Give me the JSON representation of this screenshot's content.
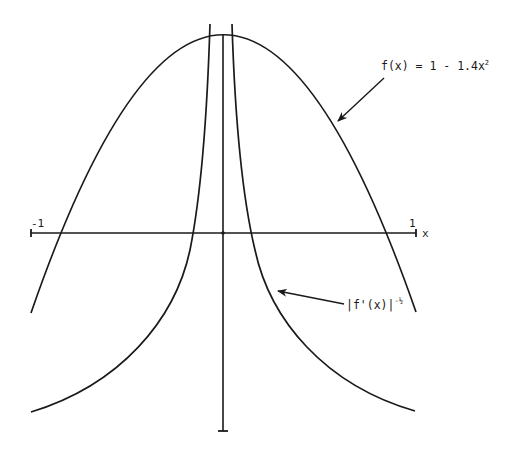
{
  "diagram": {
    "axis": {
      "x_label": "x",
      "left_tick_label": "-1",
      "right_tick_label": "1"
    },
    "labels": {
      "parabola": "f(x) = 1 - 1.4x",
      "parabola_exp": "2",
      "derivative_base": "|f'(x)|",
      "derivative_exp": "-½"
    },
    "colors": {
      "ink": "#1a1a1a",
      "background": "#ffffff"
    }
  }
}
